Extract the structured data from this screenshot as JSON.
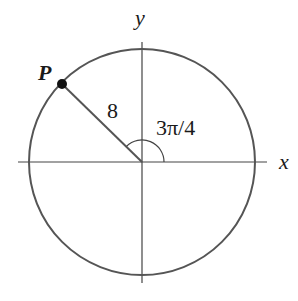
{
  "diagram": {
    "type": "unit-circle-angle",
    "labels": {
      "x_axis": "x",
      "y_axis": "y",
      "point": "P",
      "radius": "8",
      "angle": "3π/4"
    },
    "values": {
      "radius": 8,
      "angle_radians": "3π/4"
    },
    "colors": {
      "circle": "#555555",
      "axes": "#444444",
      "point": "#111111"
    }
  }
}
